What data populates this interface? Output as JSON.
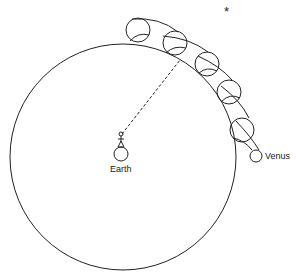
{
  "labels": {
    "earth": "Earth",
    "venus": "Venus",
    "star": "*"
  },
  "colors": {
    "stroke": "#222222",
    "background": "#ffffff"
  },
  "geometry": {
    "deferent": {
      "cx": 123,
      "cy": 157,
      "r": 113
    },
    "epicycles": [
      {
        "cx": 138,
        "cy": 30,
        "r": 12
      },
      {
        "cx": 175,
        "cy": 43,
        "r": 12
      },
      {
        "cx": 207,
        "cy": 64,
        "r": 12
      },
      {
        "cx": 229,
        "cy": 92,
        "r": 12
      },
      {
        "cx": 242,
        "cy": 130,
        "r": 12
      }
    ],
    "venus": {
      "cx": 256,
      "cy": 156,
      "r": 6
    },
    "earth": {
      "cx": 121,
      "cy": 154,
      "r": 7
    },
    "star": {
      "x": 228,
      "y": 10
    }
  }
}
